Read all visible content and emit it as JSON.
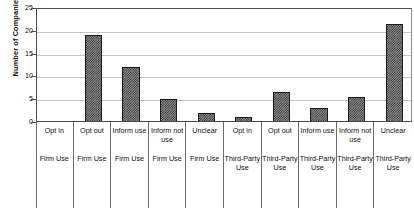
{
  "chart_data": {
    "type": "bar",
    "title": "",
    "xlabel": "",
    "ylabel": "Number of Companies",
    "ylim": [
      0,
      25
    ],
    "yticks": [
      0,
      5,
      10,
      15,
      20,
      25
    ],
    "grid": true,
    "legend": false,
    "categories": [
      "Opt in",
      "Opt out",
      "Inform use",
      "Inform not use",
      "Unclear",
      "Opt in",
      "Opt out",
      "Inform use",
      "Inform not use",
      "Unclear"
    ],
    "group_labels": [
      "Firm Use",
      "Firm Use",
      "Firm Use",
      "Firm Use",
      "Firm Use",
      "Third-Party Use",
      "Third-Party Use",
      "Third-Party Use",
      "Third-Party Use",
      "Third-Party Use"
    ],
    "values": [
      0,
      19,
      12,
      5,
      2,
      1,
      6.5,
      3,
      5.5,
      21.5
    ],
    "bars": [
      {
        "category_line1": "Opt in",
        "category_line2": "Firm Use",
        "value": 0
      },
      {
        "category_line1": "Opt out",
        "category_line2": "Firm Use",
        "value": 19
      },
      {
        "category_line1": "Inform use",
        "category_line2": "Firm Use",
        "value": 12
      },
      {
        "category_line1": "Inform not use",
        "category_line2": "Firm Use",
        "value": 5
      },
      {
        "category_line1": "Unclear",
        "category_line2": "Firm Use",
        "value": 2
      },
      {
        "category_line1": "Opt in",
        "category_line2": "Third-Party Use",
        "value": 1
      },
      {
        "category_line1": "Opt out",
        "category_line2": "Third-Party Use",
        "value": 6.5
      },
      {
        "category_line1": "Inform use",
        "category_line2": "Third-Party Use",
        "value": 3
      },
      {
        "category_line1": "Inform not use",
        "category_line2": "Third-Party Use",
        "value": 5.5
      },
      {
        "category_line1": "Unclear",
        "category_line2": "Third-Party Use",
        "value": 21.5
      }
    ],
    "colors": {
      "bar_fill": "#8f8f8f",
      "bar_pattern": "#2f2f2f",
      "bar_outline": "#1a1a1a",
      "gridline": "#c4c4c4",
      "axis": "#4d4d4d",
      "text": "#111111"
    }
  }
}
